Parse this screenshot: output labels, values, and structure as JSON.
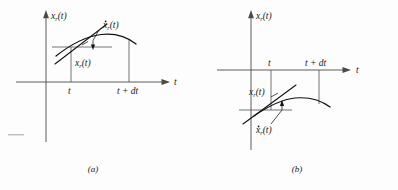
{
  "figure": {
    "background_color": "#fdfdfd",
    "ink_color": "#111111",
    "axis_color": "#4a4a4a",
    "panels": [
      {
        "id": "a",
        "caption": "(a)",
        "vertical_axis_label": {
          "base": "x",
          "subscript": "r",
          "argument": "(t)",
          "full": "x_r(t)"
        },
        "horizontal_axis_label": "t",
        "tick_labels": [
          "t",
          "t + dt"
        ],
        "value_label": {
          "base": "x",
          "subscript": "r",
          "argument": "(t)",
          "full": "x_r(t)"
        },
        "derivative_label": {
          "base": "x",
          "subscript": "r",
          "argument": "(t)",
          "full": "xdot_r(t)",
          "has_overdot": true
        },
        "curve_position": "above-axis",
        "description": "Curve x_r(t) drawn above the t axis with tangent line at time t and an interval from t to t + dt"
      },
      {
        "id": "b",
        "caption": "(b)",
        "vertical_axis_label": {
          "base": "x",
          "subscript": "r",
          "argument": "(t)",
          "full": "x_r(t)"
        },
        "horizontal_axis_label": "t",
        "tick_labels": [
          "t",
          "t + dt"
        ],
        "value_label": {
          "base": "x",
          "subscript": "r",
          "argument": "(t)",
          "full": "x_r(t)"
        },
        "derivative_label": {
          "base": "x",
          "subscript": "r",
          "argument": "(t)",
          "full": "xdot_r(t)",
          "has_overdot": true
        },
        "curve_position": "below-axis",
        "description": "Curve x_r(t) drawn below the t axis with tangent line at time t and an interval from t to t + dt"
      }
    ]
  }
}
